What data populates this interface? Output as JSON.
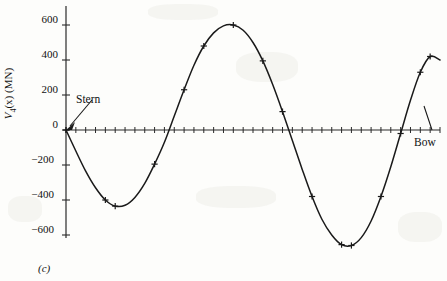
{
  "figure": {
    "caption": "(c)",
    "y_axis_label_prefix": "V",
    "y_axis_label_sub": "4",
    "y_axis_label_suffix": "(x) (MN)",
    "stern_label": "Stern",
    "bow_label": "Bow"
  },
  "chart_data": {
    "type": "line",
    "title": "",
    "subtitle": "",
    "xlabel": "",
    "ylabel": "V4(x) (MN)",
    "units": "MN",
    "grid": false,
    "legend": null,
    "annotations": [
      {
        "text": "Stern",
        "points_to": "origin (x=0, y=0)",
        "x": 0,
        "y": 0
      },
      {
        "text": "Bow",
        "points_to": "right end of x-axis",
        "x": 38,
        "y": 0
      },
      {
        "text": "(c)",
        "role": "subfigure-caption"
      }
    ],
    "xlim": [
      0,
      38
    ],
    "ylim": [
      -700,
      700
    ],
    "yticks": [
      600,
      400,
      200,
      0,
      -200,
      -400,
      -600
    ],
    "ytick_labels": [
      "600",
      "400",
      "200",
      "0",
      "−200",
      "−400",
      "−600"
    ],
    "x_axis_minor_tick_count": 38,
    "x_axis_tick_labels_shown": false,
    "series": [
      {
        "name": "V4(x)",
        "marker": "plus",
        "line": "solid",
        "color": "#1a1a1a",
        "x": [
          0,
          1,
          2,
          3,
          4,
          5,
          6,
          7,
          8,
          9,
          10,
          11,
          12,
          13,
          14,
          15,
          16,
          17,
          18,
          19,
          20,
          21,
          22,
          23,
          24,
          25,
          26,
          27,
          28,
          29,
          30,
          31,
          32,
          33,
          34,
          35,
          36,
          37,
          38
        ],
        "y": [
          0,
          -120,
          -235,
          -330,
          -400,
          -435,
          -430,
          -385,
          -305,
          -195,
          -70,
          80,
          230,
          370,
          480,
          555,
          595,
          600,
          570,
          500,
          395,
          260,
          105,
          -60,
          -225,
          -380,
          -510,
          -600,
          -655,
          -660,
          -615,
          -520,
          -380,
          -210,
          -20,
          170,
          330,
          420,
          400
        ],
        "marker_x": [
          0,
          4,
          5,
          9,
          12,
          14,
          17,
          20,
          22,
          25,
          28,
          29,
          32,
          34,
          36,
          37
        ],
        "marker_y": [
          0,
          -400,
          -435,
          -195,
          230,
          480,
          600,
          395,
          105,
          -380,
          -655,
          -660,
          -380,
          -20,
          330,
          420
        ]
      }
    ],
    "extrema": [
      {
        "kind": "minimum",
        "x": 5,
        "y": -435,
        "label": "first trough ≈ -435 MN"
      },
      {
        "kind": "maximum",
        "x": 17,
        "y": 600,
        "label": "first peak ≈ 600 MN"
      },
      {
        "kind": "minimum",
        "x": 29,
        "y": -660,
        "label": "second trough ≈ -660 MN"
      },
      {
        "kind": "maximum",
        "x": 37,
        "y": 420,
        "label": "second peak ≈ 420 MN"
      }
    ],
    "zero_crossings": [
      0,
      10.6,
      22.6,
      34.2
    ]
  }
}
